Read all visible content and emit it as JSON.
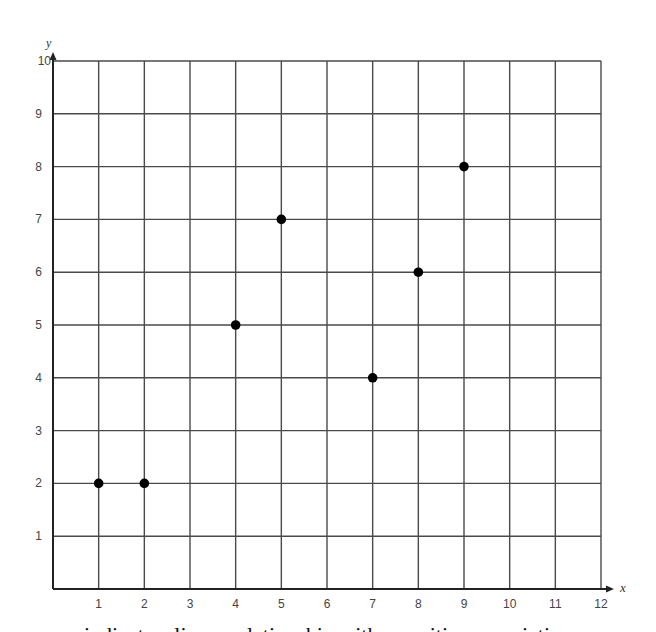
{
  "chart_data": {
    "type": "scatter",
    "title": "",
    "xlabel": "x",
    "ylabel": "y",
    "xlim": [
      0,
      12
    ],
    "ylim": [
      0,
      10
    ],
    "xticks": [
      1,
      2,
      3,
      4,
      5,
      6,
      7,
      8,
      9,
      10,
      11,
      12
    ],
    "yticks": [
      1,
      2,
      3,
      4,
      5,
      6,
      7,
      8,
      9,
      10
    ],
    "grid": true,
    "legend": null,
    "series": [
      {
        "name": "points",
        "x": [
          1,
          2,
          4,
          5,
          7,
          8,
          9
        ],
        "y": [
          2,
          2,
          5,
          7,
          4,
          6,
          8
        ]
      }
    ]
  },
  "style": {
    "grid_color": "#4a4a4a",
    "axis_color": "#222222",
    "point_color": "#000000",
    "tick_label_color": "#444444"
  },
  "caption": "indicate a linear relationship with a positive association"
}
